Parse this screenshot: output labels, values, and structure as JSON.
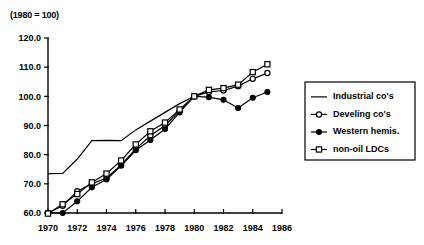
{
  "note": "(1980 = 100)",
  "legend": {
    "position": "right",
    "entries": [
      {
        "label": "Industrial  co's",
        "marker": "line-only"
      },
      {
        "label": "Develing co's",
        "marker": "open-circle"
      },
      {
        "label": "Western  hemis.",
        "marker": "filled-circle"
      },
      {
        "label": "non-oil LDCs",
        "marker": "open-square"
      }
    ]
  },
  "chart_data": {
    "type": "line",
    "title": "",
    "subtitle": "(1980 = 100)",
    "xlabel": "",
    "ylabel": "",
    "xlim": [
      1970,
      1986
    ],
    "ylim": [
      60.0,
      120.0
    ],
    "xticks": [
      1970,
      1972,
      1974,
      1976,
      1978,
      1980,
      1982,
      1984,
      1986
    ],
    "yticks": [
      60.0,
      70.0,
      80.0,
      90.0,
      100.0,
      110.0,
      120.0
    ],
    "xticklabels": [
      "1970",
      "1972",
      "1974",
      "1976",
      "1978",
      "1980",
      "1982",
      "1984",
      "1986"
    ],
    "yticklabels": [
      "60.0",
      "70.0",
      "80.0",
      "90.0",
      "100.0",
      "110.0",
      "120.0"
    ],
    "grid": false,
    "legend_position": "right",
    "x": [
      1970,
      1971,
      1972,
      1973,
      1974,
      1975,
      1976,
      1977,
      1978,
      1979,
      1980,
      1981,
      1982,
      1983,
      1984,
      1985
    ],
    "series": [
      {
        "name": "Industrial  co's",
        "marker": "none",
        "style": "solid",
        "x": [
          1970,
          1971,
          1972,
          1973,
          1974,
          1975,
          1976,
          1977,
          1978,
          1979,
          1980
        ],
        "values": [
          73.5,
          73.6,
          78.5,
          84.8,
          84.9,
          84.8,
          88.5,
          91.5,
          94.5,
          97.5,
          100.0
        ]
      },
      {
        "name": "Develing co's",
        "marker": "open-circle",
        "style": "solid",
        "x": [
          1970,
          1971,
          1972,
          1973,
          1974,
          1975,
          1976,
          1977,
          1978,
          1979,
          1980,
          1981,
          1982,
          1983,
          1984,
          1985
        ],
        "values": [
          60.0,
          62.5,
          67.5,
          70.0,
          72.0,
          76.5,
          82.0,
          86.5,
          90.0,
          95.0,
          100.0,
          101.5,
          102.0,
          103.5,
          106.0,
          108.0
        ]
      },
      {
        "name": "Western  hemis.",
        "marker": "filled-circle",
        "style": "solid",
        "x": [
          1970,
          1971,
          1972,
          1973,
          1974,
          1975,
          1976,
          1977,
          1978,
          1979,
          1980,
          1981,
          1982,
          1983,
          1984,
          1985
        ],
        "values": [
          60.0,
          60.0,
          64.0,
          68.8,
          71.5,
          76.2,
          81.5,
          85.0,
          88.8,
          94.5,
          100.0,
          99.7,
          98.8,
          96.0,
          99.5,
          101.5
        ]
      },
      {
        "name": "non-oil LDCs",
        "marker": "open-square",
        "style": "solid",
        "x": [
          1970,
          1971,
          1972,
          1973,
          1974,
          1975,
          1976,
          1977,
          1978,
          1979,
          1980,
          1981,
          1982,
          1983,
          1984,
          1985
        ],
        "values": [
          59.8,
          63.0,
          66.5,
          70.5,
          73.5,
          78.0,
          83.5,
          88.0,
          91.0,
          95.5,
          100.0,
          102.2,
          102.8,
          104.0,
          108.3,
          111.0
        ]
      }
    ]
  },
  "colors": {
    "ink": "#000000",
    "background": "#ffffff"
  }
}
